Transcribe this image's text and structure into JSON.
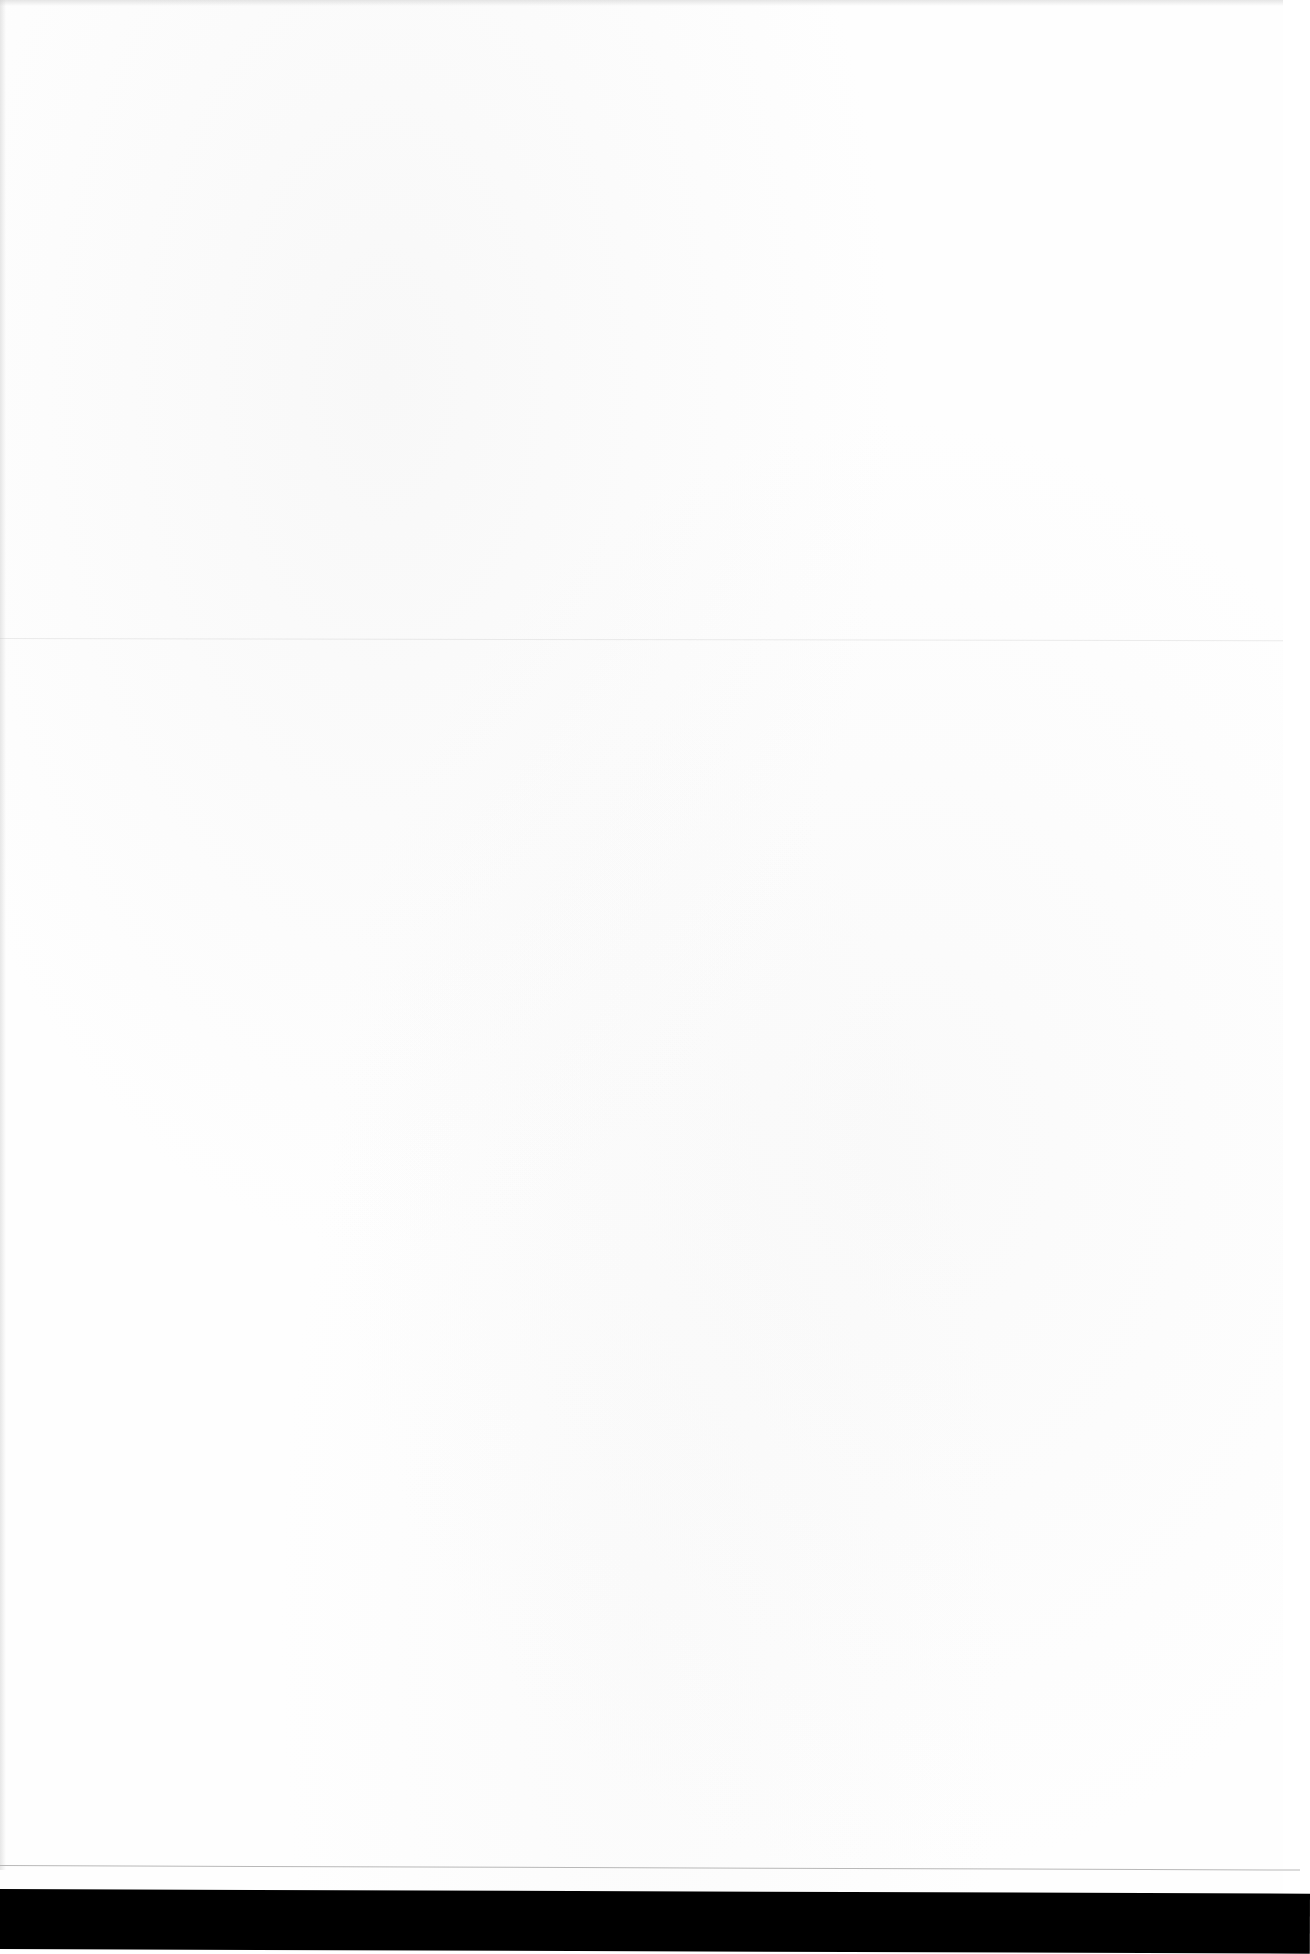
{
  "document": {
    "type": "scanned-page",
    "content": "",
    "is_blank": true
  },
  "colors": {
    "paper": "#fefefe",
    "crease_line": "#b8b8b8",
    "scanner_edge": "#000000"
  }
}
